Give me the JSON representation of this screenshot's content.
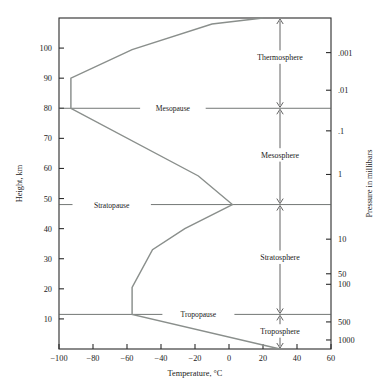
{
  "chart_data": {
    "type": "line",
    "title": "",
    "xlabel": "Temperature, °C",
    "ylabel": "Height, km",
    "y2label": "Pressure in millibars",
    "xlim": [
      -100,
      60
    ],
    "ylim": [
      0,
      110
    ],
    "grid": false,
    "legend": "none",
    "xticks": [
      -100,
      -80,
      -60,
      -40,
      -20,
      0,
      20,
      40,
      60
    ],
    "xticklabels": [
      "−100",
      "−80",
      "−60",
      "−40",
      "−20",
      "0",
      "20",
      "40",
      "60"
    ],
    "yticks": [
      10,
      20,
      30,
      40,
      50,
      60,
      70,
      80,
      90,
      100
    ],
    "yticklabels": [
      "10",
      "20",
      "30",
      "40",
      "50",
      "60",
      "70",
      "80",
      "90",
      "100"
    ],
    "pressure_ticks": [
      {
        "label": ".001",
        "height_km": 98.5
      },
      {
        "label": ".01",
        "height_km": 86.0
      },
      {
        "label": ".1",
        "height_km": 72.5
      },
      {
        "label": "1",
        "height_km": 58.0
      },
      {
        "label": "10",
        "height_km": 36.5
      },
      {
        "label": "50",
        "height_km": 25.0
      },
      {
        "label": "100",
        "height_km": 21.5
      },
      {
        "label": "500",
        "height_km": 9.0
      },
      {
        "label": "1000",
        "height_km": 3.0
      }
    ],
    "series": [
      {
        "name": "U.S. Standard Atmosphere temperature profile",
        "color": "#8a8f8c",
        "points": [
          {
            "t": 30,
            "h": 0
          },
          {
            "t": -57,
            "h": 11.5
          },
          {
            "t": -57,
            "h": 20.5
          },
          {
            "t": -45,
            "h": 33.0
          },
          {
            "t": -26,
            "h": 40.0
          },
          {
            "t": 2,
            "h": 48.0
          },
          {
            "t": -18,
            "h": 57.5
          },
          {
            "t": -93,
            "h": 80.0
          },
          {
            "t": -93,
            "h": 90.0
          },
          {
            "t": -57,
            "h": 99.5
          },
          {
            "t": -10,
            "h": 108.0
          },
          {
            "t": 20,
            "h": 110.0
          }
        ]
      }
    ],
    "boundaries": [
      {
        "name": "Mesopause",
        "height_km": 80.0,
        "label_t": -33
      },
      {
        "name": "Stratopause",
        "height_km": 48.0,
        "label_t": -69
      },
      {
        "name": "Tropopause",
        "height_km": 11.5,
        "label_t": -18
      }
    ],
    "layers": [
      {
        "name": "Thermosphere",
        "top_km": 110.0,
        "bottom_km": 80.0,
        "label_km": 97.0
      },
      {
        "name": "Mesosphere",
        "top_km": 80.0,
        "bottom_km": 48.0,
        "label_km": 64.5
      },
      {
        "name": "Stratosphere",
        "top_km": 48.0,
        "bottom_km": 11.5,
        "label_km": 30.5
      },
      {
        "name": "Troposphere",
        "top_km": 11.5,
        "bottom_km": 0.0,
        "label_km": 6.0
      }
    ],
    "arrow_t": 30
  },
  "colors": {
    "profile": "#8a8f8c",
    "axis": "#2b2b2b",
    "pause": "#5a5f5c",
    "arrow": "#3a3a3a",
    "background": "#ffffff"
  }
}
